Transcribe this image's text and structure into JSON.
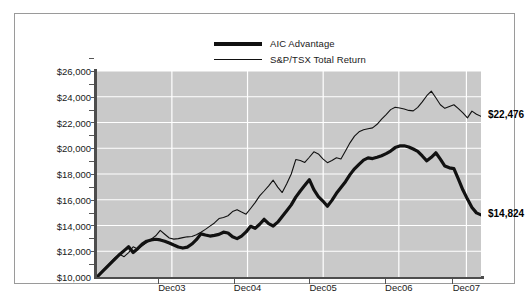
{
  "chart_data": {
    "type": "line",
    "title": "",
    "subtitle": "",
    "xlabel": "",
    "ylabel": "",
    "ylim": [
      10000,
      26000
    ],
    "ytick_step": 2000,
    "ytick_labels": [
      "$26,000",
      "$24,000",
      "$22,000",
      "$20,000",
      "$18,000",
      "$16,000",
      "$14,000",
      "$12,000",
      "$10,000"
    ],
    "ytick_values": [
      26000,
      24000,
      22000,
      20000,
      18000,
      16000,
      14000,
      12000,
      10000
    ],
    "xtick_labels": [
      "Dec03",
      "Dec04",
      "Dec05",
      "Dec06",
      "Dec07"
    ],
    "xtick_positions": [
      0.195,
      0.392,
      0.589,
      0.786,
      0.962
    ],
    "grid": "horizontal-and-vertical",
    "legend_position": "top-center",
    "plot_background": "#c9c9c9",
    "gridline_color": "#ffffff",
    "series": [
      {
        "name": "AIC Advantage",
        "color": "#111111",
        "line_width": "thick",
        "end_label": "$14,824",
        "end_value": 14824,
        "values": [
          10000,
          10350,
          10700,
          11050,
          11400,
          11750,
          12050,
          12350,
          11900,
          12200,
          12550,
          12780,
          12880,
          12930,
          12880,
          12780,
          12640,
          12480,
          12330,
          12250,
          12320,
          12560,
          12900,
          13350,
          13260,
          13180,
          13230,
          13310,
          13480,
          13420,
          13120,
          12980,
          13180,
          13500,
          13940,
          13780,
          14100,
          14480,
          14140,
          13960,
          14260,
          14700,
          15140,
          15600,
          16200,
          16680,
          17120,
          17560,
          16780,
          16240,
          15900,
          15500,
          15950,
          16500,
          16950,
          17400,
          17950,
          18400,
          18750,
          19080,
          19250,
          19200,
          19300,
          19420,
          19580,
          19780,
          20050,
          20180,
          20190,
          20100,
          19940,
          19760,
          19400,
          19020,
          19300,
          19650,
          19150,
          18620,
          18480,
          18420,
          17600,
          16750,
          16050,
          15400,
          14980,
          14824
        ]
      },
      {
        "name": "S&P/TSX Total Return",
        "color": "#111111",
        "line_width": "thin",
        "end_label": "$22,476",
        "end_value": 22476,
        "values": [
          10000,
          10380,
          10760,
          11140,
          11500,
          11760,
          11580,
          11900,
          12350,
          12180,
          12420,
          12680,
          12940,
          13200,
          13620,
          13320,
          13030,
          12940,
          12980,
          13060,
          13120,
          13140,
          13280,
          13480,
          13700,
          13950,
          14200,
          14540,
          14620,
          14760,
          15080,
          15230,
          15050,
          14880,
          15320,
          15780,
          16300,
          16680,
          17080,
          17520,
          16980,
          16560,
          17240,
          18000,
          19120,
          19050,
          18900,
          19300,
          19720,
          19560,
          19180,
          18880,
          19050,
          19260,
          19160,
          19780,
          20420,
          20940,
          21280,
          21440,
          21520,
          21580,
          21860,
          22260,
          22620,
          23000,
          23180,
          23120,
          23050,
          22940,
          22900,
          23180,
          23600,
          24080,
          24440,
          23920,
          23380,
          23100,
          23240,
          23380,
          23080,
          22740,
          22360,
          22880,
          22640,
          22476
        ]
      }
    ]
  },
  "legend": {
    "items": [
      {
        "label": "AIC Advantage",
        "style": "thick"
      },
      {
        "label": "S&P/TSX Total Return",
        "style": "thin"
      }
    ]
  },
  "end_labels": {
    "tsx": "$22,476",
    "aic": "$14,824"
  }
}
